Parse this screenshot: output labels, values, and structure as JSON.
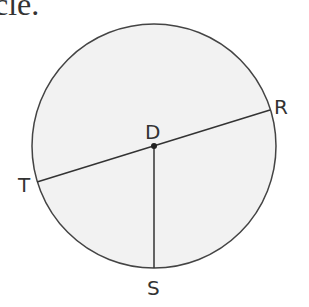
{
  "caption_fragment": "cle.",
  "diagram": {
    "circle": {
      "cx": 154,
      "cy": 146,
      "r": 122,
      "fill": "#f2f2f2",
      "stroke": "#444444"
    },
    "center_label": "D",
    "points": [
      {
        "label": "R",
        "x": 270,
        "y": 110
      },
      {
        "label": "T",
        "x": 37,
        "y": 182
      },
      {
        "label": "S",
        "x": 154,
        "y": 268
      }
    ],
    "segments": [
      "TR (diameter through D)",
      "DS (radius)"
    ]
  }
}
